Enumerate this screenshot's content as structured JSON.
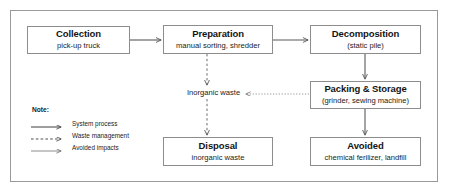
{
  "diagram": {
    "frame_color": "#9a9a9a",
    "box_border_color": "#8d8d8d",
    "line_color": "#595959",
    "text_color": "#141414",
    "nodes": [
      {
        "id": "collection",
        "title": "Collection",
        "sub": "pick-up truck"
      },
      {
        "id": "preparation",
        "title": "Preparation",
        "sub": "manual sorting, shredder"
      },
      {
        "id": "decomposition",
        "title": "Decomposition",
        "sub": "(static pile)"
      },
      {
        "id": "packing",
        "title": "Packing & Storage",
        "sub": "(grinder, sewing machine)"
      },
      {
        "id": "disposal",
        "title": "Disposal",
        "sub": "inorganic waste"
      },
      {
        "id": "avoided",
        "title": "Avoided",
        "sub": "chemical ferilizer, landfill"
      }
    ],
    "edge_labels": {
      "inorganic_waste": "Inorganic waste"
    },
    "edges": [
      {
        "from": "collection",
        "to": "preparation",
        "style": "solid"
      },
      {
        "from": "preparation",
        "to": "decomposition",
        "style": "solid"
      },
      {
        "from": "decomposition",
        "to": "packing",
        "style": "solid"
      },
      {
        "from": "packing",
        "to": "avoided",
        "style": "solid"
      },
      {
        "from": "preparation",
        "to": "inorganic_waste_label",
        "style": "dashed"
      },
      {
        "from": "inorganic_waste_label",
        "to": "disposal",
        "style": "dashed"
      },
      {
        "from": "packing",
        "to": "inorganic_waste_label",
        "style": "dotted"
      }
    ]
  },
  "legend": {
    "note_label": "Note:",
    "items": [
      {
        "style": "solid",
        "label": "System process"
      },
      {
        "style": "dashed",
        "label": "Waste management"
      },
      {
        "style": "thin",
        "label": "Avoided impacts"
      }
    ]
  }
}
